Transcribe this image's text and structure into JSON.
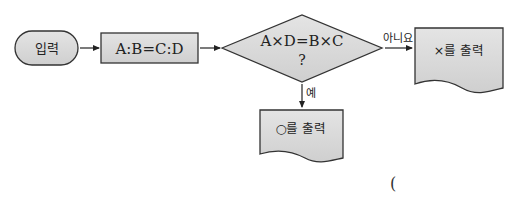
{
  "flowchart": {
    "start": {
      "label": "입력",
      "shape": "terminal"
    },
    "process": {
      "label": "A:B=C:D",
      "shape": "rectangle"
    },
    "decision": {
      "line1": "A×D=B×C",
      "line2": "?",
      "shape": "diamond"
    },
    "no_branch": {
      "label": "아니요",
      "output": "×를 출력",
      "shape": "document"
    },
    "yes_branch": {
      "label": "예",
      "output": "○를 출력",
      "shape": "document"
    }
  },
  "answer_blank": {
    "open_paren": "("
  },
  "colors": {
    "fill": "#d6d6d6",
    "stroke": "#333333",
    "text": "#222222",
    "background": "#ffffff"
  }
}
